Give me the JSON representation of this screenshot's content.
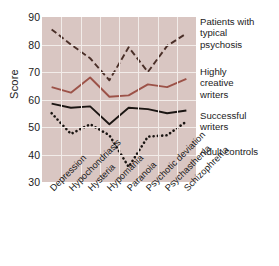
{
  "chart_data": {
    "type": "line",
    "title": "",
    "xlabel": "",
    "ylabel": "Score",
    "ylim": [
      30,
      90
    ],
    "ytick_step": 10,
    "yticks": [
      90,
      80,
      70,
      60,
      50,
      40,
      30
    ],
    "grid": true,
    "legend_position": "right",
    "plot_background": "#d9c6c2",
    "categories": [
      "Depression",
      "Hypochondriasis",
      "Hysteria",
      "Hypomania",
      "Paranoia",
      "Psychotic deviation",
      "Psychasthenia",
      "Schizophrenia"
    ],
    "series": [
      {
        "name": "Patients with typical psychosis",
        "legend_lines": [
          "Patients with",
          "typical",
          "psychosis"
        ],
        "style": "dashed",
        "color": "#4a2f28",
        "values": [
          85.5,
          80.0,
          75.0,
          67.0,
          79.0,
          70.0,
          79.5,
          84.0
        ]
      },
      {
        "name": "Highly creative writers",
        "legend_lines": [
          "Highly",
          "creative",
          "writers"
        ],
        "style": "solid",
        "color": "#9c5248",
        "values": [
          64.5,
          62.5,
          68.0,
          61.0,
          61.5,
          65.5,
          64.5,
          67.5
        ]
      },
      {
        "name": "Successful writers",
        "legend_lines": [
          "Successful",
          "writers"
        ],
        "style": "solid",
        "color": "#1a1512",
        "values": [
          58.5,
          57.0,
          57.5,
          51.0,
          57.0,
          56.5,
          55.0,
          56.0
        ]
      },
      {
        "name": "Adult controls",
        "legend_lines": [
          "Adult controls"
        ],
        "style": "dotted",
        "color": "#1a1512",
        "values": [
          55.0,
          47.5,
          51.0,
          47.0,
          35.5,
          46.5,
          47.0,
          52.0
        ]
      }
    ]
  }
}
